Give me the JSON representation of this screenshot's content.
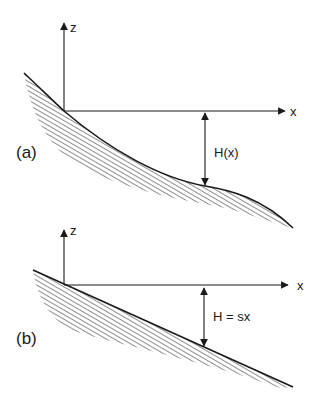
{
  "panels": [
    {
      "id": "a",
      "panel_label": "(a)",
      "axis_z_label": "z",
      "axis_x_label": "x",
      "depth_label": "H(x)",
      "bed_shape": "curved"
    },
    {
      "id": "b",
      "panel_label": "(b)",
      "axis_z_label": "z",
      "axis_x_label": "x",
      "depth_label": "H = sx",
      "bed_shape": "linear slope"
    }
  ],
  "colors": {
    "line": "#1a1a1a",
    "hatch": "#333333",
    "background": "#ffffff"
  }
}
